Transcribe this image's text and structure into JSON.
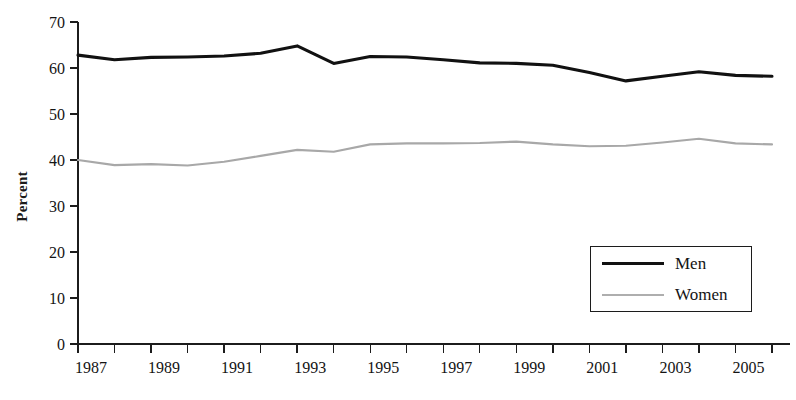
{
  "chart_data": {
    "type": "line",
    "title": "",
    "subtitle": "",
    "xlabel": "",
    "ylabel": "Percent",
    "ylim": [
      0,
      70
    ],
    "xlim": [
      1987,
      2006
    ],
    "ytick_values": [
      0,
      10,
      20,
      30,
      40,
      50,
      60,
      70
    ],
    "ytick_labels": [
      "0",
      "10",
      "20",
      "30",
      "40",
      "50",
      "60",
      "70"
    ],
    "x": [
      1987,
      1988,
      1989,
      1990,
      1991,
      1992,
      1993,
      1994,
      1995,
      1996,
      1997,
      1998,
      1999,
      2000,
      2001,
      2002,
      2003,
      2004,
      2005,
      2006
    ],
    "xtick_values": [
      1987,
      1988,
      1989,
      1990,
      1991,
      1992,
      1993,
      1994,
      1995,
      1996,
      1997,
      1998,
      1999,
      2000,
      2001,
      2002,
      2003,
      2004,
      2005,
      2006
    ],
    "xtick_labels": [
      "1987",
      "",
      "1989",
      "",
      "1991",
      "",
      "1993",
      "",
      "1995",
      "",
      "1997",
      "",
      "1999",
      "",
      "2001",
      "",
      "2003",
      "",
      "2005",
      ""
    ],
    "grid": false,
    "legend_position": "lower-right",
    "series": [
      {
        "name": "Men",
        "color": "#111111",
        "linewidth": 3.1,
        "values": [
          62.8,
          61.8,
          62.3,
          62.4,
          62.6,
          63.2,
          64.8,
          61.0,
          62.5,
          62.4,
          61.8,
          61.1,
          61.0,
          60.6,
          59.0,
          57.2,
          58.2,
          59.2,
          58.4,
          58.2
        ]
      },
      {
        "name": "Women",
        "color": "#a8a8a8",
        "linewidth": 2.1,
        "values": [
          40.0,
          38.9,
          39.1,
          38.8,
          39.6,
          40.9,
          42.2,
          41.8,
          43.4,
          43.6,
          43.6,
          43.7,
          44.0,
          43.4,
          43.0,
          43.1,
          43.8,
          44.6,
          43.6,
          43.4
        ]
      }
    ],
    "legend_entries": [
      {
        "label": "Men",
        "swatch": "thick-black-line"
      },
      {
        "label": "Women",
        "swatch": "thin-gray-line"
      }
    ]
  },
  "axis": {
    "y_title": "Percent"
  },
  "legend": {
    "men_label": "Men",
    "women_label": "Women"
  }
}
